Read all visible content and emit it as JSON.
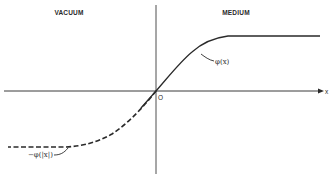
{
  "diagram": {
    "regions": {
      "left": "VACUUM",
      "right": "MEDIUM"
    },
    "axes": {
      "origin_label": "O",
      "x_label": "x"
    },
    "curves": {
      "solid": {
        "label": "φ(x)",
        "style": "solid",
        "color": "#2a2a2a"
      },
      "dashed": {
        "label": "−φ(|x|)",
        "style": "dashed",
        "color": "#2a2a2a"
      }
    }
  }
}
